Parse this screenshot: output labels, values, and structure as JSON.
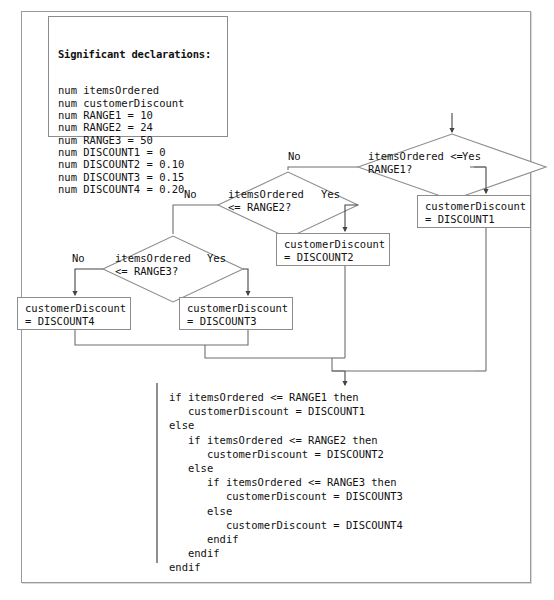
{
  "figure": {
    "line_color": "#6e6e6e",
    "box_border_color": "#8c8c8c",
    "text_color": "#111111",
    "background": "#ffffff"
  },
  "declarations": {
    "header": "Significant declarations:",
    "lines": [
      "num itemsOrdered",
      "num customerDiscount",
      "num RANGE1 = 10",
      "num RANGE2 = 24",
      "num RANGE3 = 50",
      "num DISCOUNT1 = 0",
      "num DISCOUNT2 = 0.10",
      "num DISCOUNT3 = 0.15",
      "num DISCOUNT4 = 0.20"
    ],
    "text": "num itemsOrdered\nnum customerDiscount\nnum RANGE1 = 10\nnum RANGE2 = 24\nnum RANGE3 = 50\nnum DISCOUNT1 = 0\nnum DISCOUNT2 = 0.10\nnum DISCOUNT3 = 0.15\nnum DISCOUNT4 = 0.20"
  },
  "decisions": [
    {
      "id": "decision-range1",
      "text": "itemsOrdered <=\nRANGE1?",
      "yes_label": "Yes",
      "no_label": "No"
    },
    {
      "id": "decision-range2",
      "text": "itemsOrdered\n<= RANGE2?",
      "yes_label": "Yes",
      "no_label": "No"
    },
    {
      "id": "decision-range3",
      "text": "itemsOrdered\n<= RANGE3?",
      "yes_label": "Yes",
      "no_label": "No"
    }
  ],
  "processes": [
    {
      "id": "process-discount1",
      "text": "customerDiscount\n= DISCOUNT1"
    },
    {
      "id": "process-discount2",
      "text": "customerDiscount\n= DISCOUNT2"
    },
    {
      "id": "process-discount3",
      "text": "customerDiscount\n= DISCOUNT3"
    },
    {
      "id": "process-discount4",
      "text": "customerDiscount\n= DISCOUNT4"
    }
  ],
  "pseudocode": {
    "lines": [
      "if itemsOrdered <= RANGE1 then",
      "   customerDiscount = DISCOUNT1",
      "else",
      "   if itemsOrdered <= RANGE2 then",
      "      customerDiscount = DISCOUNT2",
      "   else",
      "      if itemsOrdered <= RANGE3 then",
      "         customerDiscount = DISCOUNT3",
      "      else",
      "         customerDiscount = DISCOUNT4",
      "      endif",
      "   endif",
      "endif"
    ],
    "text": "if itemsOrdered <= RANGE1 then\n   customerDiscount = DISCOUNT1\nelse\n   if itemsOrdered <= RANGE2 then\n      customerDiscount = DISCOUNT2\n   else\n      if itemsOrdered <= RANGE3 then\n         customerDiscount = DISCOUNT3\n      else\n         customerDiscount = DISCOUNT4\n      endif\n   endif\nendif"
  }
}
